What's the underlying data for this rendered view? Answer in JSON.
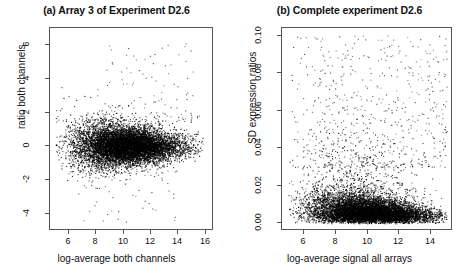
{
  "figure": {
    "background": "#ffffff",
    "point_color": "#000000",
    "axis_color": "#555555"
  },
  "chart_data": [
    {
      "type": "scatter",
      "panel": "a",
      "title": "(a) Array 3 of Experiment D2.6",
      "xlabel": "log-average both channels",
      "ylabel": "ratio both channels",
      "xlim": [
        4.6,
        16.6
      ],
      "ylim": [
        -5.0,
        7.0
      ],
      "xticks": [
        6,
        8,
        10,
        12,
        14,
        16
      ],
      "xticklabels": [
        "6",
        "8",
        "10",
        "12",
        "14",
        "16"
      ],
      "yticks": [
        -4,
        -2,
        0,
        2,
        4,
        6
      ],
      "yticklabels": [
        "-4",
        "-2",
        "0",
        "2",
        "4",
        "6"
      ],
      "grid": false,
      "legend": "none",
      "n_points": 9000,
      "description": "MA-plot: dense horizontal cloud centred on ratio 0, widening at low log-average, sparse positive outliers up to 6.5 and negative outliers to -4.5",
      "cloud": {
        "x_mean": 10.2,
        "x_sd": 1.9,
        "x_min": 5.0,
        "x_max": 15.8,
        "y_center": 0.0,
        "y_sd_at_low_x": 0.95,
        "y_sd_at_high_x": 0.35,
        "skew_positive": 0.35
      },
      "outliers": {
        "count": 120,
        "y_range": [
          1.5,
          6.5
        ],
        "x_range": [
          8.0,
          15.5
        ]
      }
    },
    {
      "type": "scatter",
      "panel": "b",
      "title": "(b) Complete experiment D2.6",
      "xlabel": "log-average signal all arrays",
      "ylabel": "SD expression ratios",
      "xlim": [
        4.6,
        15.4
      ],
      "ylim": [
        -0.004,
        0.104
      ],
      "xticks": [
        6,
        8,
        10,
        12,
        14
      ],
      "xticklabels": [
        "6",
        "8",
        "10",
        "12",
        "14"
      ],
      "yticks": [
        0.0,
        0.02,
        0.04,
        0.06,
        0.08,
        0.1
      ],
      "yticklabels": [
        "0.00",
        "0.02",
        "0.04",
        "0.06",
        "0.08",
        "0.10"
      ],
      "grid": false,
      "legend": "none",
      "n_points": 9000,
      "description": "SD of expression ratios vs log-average signal: dense band hugging SD 0.00-0.015 with a long upward tail of scattered points reaching 0.10, widest spread around log-average 6-10",
      "cloud": {
        "x_mean": 10.0,
        "x_sd": 1.9,
        "x_min": 5.0,
        "x_max": 15.0,
        "sd_base": 0.004,
        "sd_scale_low_x": 0.022,
        "sd_scale_high_x": 0.006,
        "y_max": 0.1
      },
      "outliers": {
        "count": 600,
        "y_range": [
          0.03,
          0.1
        ],
        "x_range": [
          5.2,
          15.0
        ]
      }
    }
  ]
}
